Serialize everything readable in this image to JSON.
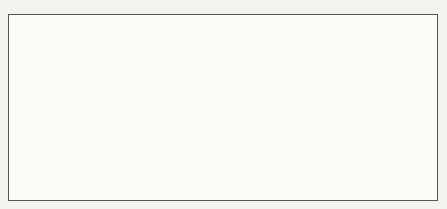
{
  "chart_data": [
    {
      "type": "stem",
      "title": "Input signal x[n]",
      "xlabel": "n",
      "ylabel": "",
      "xlim": [
        -1,
        20
      ],
      "ylim": [
        -8,
        7
      ],
      "xticks": [
        0,
        10,
        20
      ],
      "yticks": [
        -8,
        -6,
        -4,
        -2,
        0,
        2,
        4,
        6
      ],
      "x": [
        0,
        1,
        2,
        3,
        4,
        5,
        6,
        7,
        8,
        9,
        10,
        11,
        12,
        13,
        14,
        15,
        16,
        17,
        18,
        19
      ],
      "values": [
        1,
        1,
        1,
        1,
        1,
        1,
        1,
        1,
        1,
        1,
        1,
        1,
        1,
        1,
        1,
        1,
        1,
        1,
        1,
        1
      ]
    },
    {
      "type": "stem",
      "title": "Integrator w[n]",
      "xlabel": "n",
      "ylabel": "",
      "xlim": [
        -1,
        20
      ],
      "ylim": [
        -8,
        7
      ],
      "xticks": [
        0,
        10,
        20
      ],
      "yticks": [
        -8,
        -6,
        -4,
        -2,
        0,
        2,
        4,
        6
      ],
      "x": [
        0,
        1,
        2,
        3,
        4,
        5,
        6,
        7,
        8,
        9,
        10,
        11,
        12,
        13,
        14,
        15,
        16,
        17,
        18,
        19
      ],
      "values": [
        1,
        2,
        3,
        4,
        5,
        6,
        7,
        -8,
        -7,
        -6,
        -5,
        -4,
        -3,
        -2,
        -1,
        0,
        1,
        2,
        3,
        4
      ]
    },
    {
      "type": "stem",
      "title": "Output y[n]",
      "xlabel": "n",
      "ylabel": "",
      "xlim": [
        -1,
        20
      ],
      "ylim": [
        -8,
        7
      ],
      "xticks": [
        0,
        10,
        20
      ],
      "yticks": [
        -8,
        -6,
        -4,
        -2,
        0,
        2,
        4,
        6
      ],
      "x": [
        0,
        1,
        2,
        3,
        4,
        5,
        6,
        7,
        8,
        9,
        10,
        11,
        12,
        13,
        14,
        15,
        16,
        17,
        18,
        19
      ],
      "values": [
        1,
        2,
        3,
        4,
        5,
        6,
        6,
        6,
        6,
        6,
        6,
        6,
        6,
        6,
        6,
        6,
        6,
        6,
        6,
        6
      ]
    }
  ],
  "panels": [
    {
      "title": "Input signal x[n]",
      "xlabel": "n"
    },
    {
      "title": "Integrator w[n]",
      "xlabel": "n"
    },
    {
      "title": "Output y[n]",
      "xlabel": "n"
    }
  ]
}
